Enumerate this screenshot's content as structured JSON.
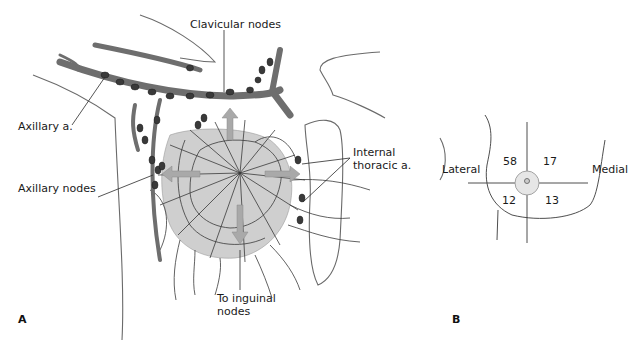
{
  "figure": {
    "panel_a": {
      "letter": "A",
      "labels": {
        "clavicular_nodes": "Clavicular nodes",
        "axillary_artery": "Axillary a.",
        "axillary_nodes": "Axillary nodes",
        "internal_thoracic": "Internal\nthoracic a.",
        "to_inguinal": "To inguinal\nnodes"
      }
    },
    "panel_b": {
      "letter": "B",
      "labels": {
        "lateral": "Lateral",
        "medial": "Medial"
      },
      "quadrants": {
        "upper_outer": "58",
        "upper_inner": "17",
        "lower_outer": "12",
        "lower_inner": "13"
      }
    },
    "colors": {
      "vessel": "#6e6e6e",
      "node": "#3a3a3a",
      "gland": "#cfcfcf",
      "arrow": "#a9a9a9",
      "line": "#4a4a4a"
    }
  }
}
